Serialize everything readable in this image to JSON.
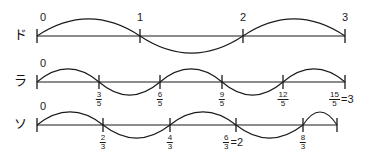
{
  "figure": {
    "type": "number-line-diagram",
    "background_color": "#ffffff",
    "stroke_color": "#1a1a1a",
    "rows": [
      {
        "note_label": "ド",
        "axis_y": 36,
        "x_start": 37,
        "x_end": 345,
        "wave_amplitude": 17,
        "ticks": [
          {
            "value": 0,
            "x": 37,
            "label": "0",
            "label_kind": "integer",
            "label_position": "above"
          },
          {
            "value": 1,
            "x": 140,
            "label": "1",
            "label_kind": "integer",
            "label_position": "above"
          },
          {
            "value": 2,
            "x": 243,
            "label": "2",
            "label_kind": "integer",
            "label_position": "above"
          },
          {
            "value": 3,
            "x": 345,
            "label": "3",
            "label_kind": "integer",
            "label_position": "above"
          }
        ]
      },
      {
        "note_label": "ラ",
        "axis_y": 82,
        "x_start": 37,
        "x_end": 345,
        "wave_amplitude": 13,
        "ticks": [
          {
            "value": 0,
            "x": 37,
            "label": "0",
            "label_kind": "integer",
            "label_position": "above"
          },
          {
            "numerator": "3",
            "denominator": "5",
            "x": 99,
            "label_kind": "fraction",
            "label_position": "below"
          },
          {
            "numerator": "6",
            "denominator": "5",
            "x": 160,
            "label_kind": "fraction",
            "label_position": "below"
          },
          {
            "numerator": "9",
            "denominator": "5",
            "x": 222,
            "label_kind": "fraction",
            "label_position": "below"
          },
          {
            "numerator": "12",
            "denominator": "5",
            "x": 283,
            "label_kind": "fraction",
            "label_position": "below"
          },
          {
            "numerator": "15",
            "denominator": "5",
            "equals": "=3",
            "x": 345,
            "label_kind": "fraction",
            "label_position": "below"
          }
        ]
      },
      {
        "note_label": "ソ",
        "axis_y": 125,
        "x_start": 37,
        "x_end": 337,
        "wave_amplitude": 13,
        "ticks": [
          {
            "value": 0,
            "x": 37,
            "label": "0",
            "label_kind": "integer",
            "label_position": "above"
          },
          {
            "numerator": "2",
            "denominator": "3",
            "x": 103,
            "label_kind": "fraction",
            "label_position": "below"
          },
          {
            "numerator": "4",
            "denominator": "3",
            "x": 170,
            "label_kind": "fraction",
            "label_position": "below"
          },
          {
            "numerator": "6",
            "denominator": "3",
            "equals": "=2",
            "x": 236,
            "label_kind": "fraction",
            "label_position": "below"
          },
          {
            "numerator": "8",
            "denominator": "3",
            "x": 303,
            "label_kind": "fraction",
            "label_position": "below"
          },
          {
            "x": 337,
            "label_kind": "none",
            "label_position": "none"
          }
        ]
      }
    ]
  }
}
